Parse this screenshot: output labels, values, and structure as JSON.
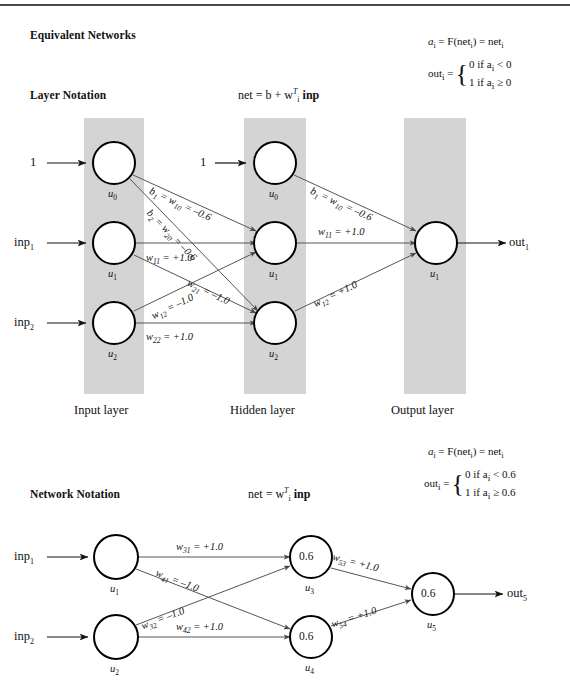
{
  "figure": {
    "title": "Equivalent Networks"
  },
  "sections": [
    {
      "id": "layer",
      "heading": "Layer Notation",
      "net_equation": "net = b + w",
      "net_equation_sup": "T",
      "net_equation_sub": "i",
      "net_equation_tail": "inp",
      "activation": {
        "a_label": "a",
        "a_sub": "i",
        "eq1": "= F(net",
        "eq1_sub": "i",
        "eq1_tail": ") = net",
        "eq1_tail_sub": "i",
        "out_label": "out",
        "out_sub": "i",
        "out_eq": "=",
        "case_0": "0  if a",
        "case_0_sub": "i",
        "case_0_tail": "< 0",
        "case_1": "1  if a",
        "case_1_sub": "i",
        "case_1_tail": "≥ 0"
      },
      "layer_captions": [
        "Input layer",
        "Hidden layer",
        "Output layer"
      ],
      "inputs": [
        {
          "label": "1",
          "sub": ""
        },
        {
          "label": "inp",
          "sub": "1"
        },
        {
          "label": "inp",
          "sub": "2"
        }
      ],
      "output": {
        "label": "out",
        "sub": "1"
      },
      "nodes": [
        {
          "id": "in-u0",
          "name": "u",
          "sub": "0",
          "value": "",
          "layer": "input"
        },
        {
          "id": "in-u1",
          "name": "u",
          "sub": "1",
          "value": "",
          "layer": "input"
        },
        {
          "id": "in-u2",
          "name": "u",
          "sub": "2",
          "value": "",
          "layer": "input"
        },
        {
          "id": "hid-u0",
          "name": "u",
          "sub": "0",
          "value": "",
          "layer": "hidden"
        },
        {
          "id": "hid-u1",
          "name": "u",
          "sub": "1",
          "value": "",
          "layer": "hidden"
        },
        {
          "id": "hid-u2",
          "name": "u",
          "sub": "2",
          "value": "",
          "layer": "hidden"
        },
        {
          "id": "out-u1",
          "name": "u",
          "sub": "1",
          "value": "",
          "layer": "output"
        }
      ],
      "hidden_bias_input": "1",
      "edges": [
        {
          "id": "e-b1",
          "text": "b",
          "sub": "1",
          "mid": "= w",
          "mid_sub": "10",
          "tail": "= –0.6"
        },
        {
          "id": "e-b2",
          "text": "b",
          "sub": "2",
          "mid": "= w",
          "mid_sub": "20",
          "tail": "= –0.6"
        },
        {
          "id": "e-w11",
          "text": "w",
          "sub": "11",
          "mid": "",
          "mid_sub": "",
          "tail": "= +1.0"
        },
        {
          "id": "e-w21",
          "text": "w",
          "sub": "21",
          "mid": "",
          "mid_sub": "",
          "tail": "= –1.0"
        },
        {
          "id": "e-w12",
          "text": "w",
          "sub": "12",
          "mid": "",
          "mid_sub": "",
          "tail": "= –1.0"
        },
        {
          "id": "e-w22",
          "text": "w",
          "sub": "22",
          "mid": "",
          "mid_sub": "",
          "tail": "= +1.0"
        },
        {
          "id": "e-hb1",
          "text": "b",
          "sub": "1",
          "mid": "= w",
          "mid_sub": "10",
          "tail": "= –0.6"
        },
        {
          "id": "e-hw11",
          "text": "w",
          "sub": "11",
          "mid": "",
          "mid_sub": "",
          "tail": "= +1.0"
        },
        {
          "id": "e-hw12",
          "text": "w",
          "sub": "12",
          "mid": "",
          "mid_sub": "",
          "tail": "= +1.0"
        }
      ]
    },
    {
      "id": "network",
      "heading": "Network Notation",
      "net_equation": "net = w",
      "net_equation_sup": "T",
      "net_equation_sub": "i",
      "net_equation_tail": "inp",
      "activation": {
        "a_label": "a",
        "a_sub": "i",
        "eq1": "= F(net",
        "eq1_sub": "i",
        "eq1_tail": ") = net",
        "eq1_tail_sub": "i",
        "out_label": "out",
        "out_sub": "i",
        "out_eq": "=",
        "case_0": "0  if a",
        "case_0_sub": "i",
        "case_0_tail": "< 0.6",
        "case_1": "1  if a",
        "case_1_sub": "i",
        "case_1_tail": "≥ 0.6"
      },
      "inputs": [
        {
          "label": "inp",
          "sub": "1"
        },
        {
          "label": "inp",
          "sub": "2"
        }
      ],
      "output": {
        "label": "out",
        "sub": "5"
      },
      "nodes": [
        {
          "id": "n-u1",
          "name": "u",
          "sub": "1",
          "value": ""
        },
        {
          "id": "n-u2",
          "name": "u",
          "sub": "2",
          "value": ""
        },
        {
          "id": "n-u3",
          "name": "u",
          "sub": "3",
          "value": "0.6"
        },
        {
          "id": "n-u4",
          "name": "u",
          "sub": "4",
          "value": "0.6"
        },
        {
          "id": "n-u5",
          "name": "u",
          "sub": "5",
          "value": "0.6"
        }
      ],
      "edges": [
        {
          "id": "e-w31",
          "text": "w",
          "sub": "31",
          "tail": "= +1.0"
        },
        {
          "id": "e-w41",
          "text": "w",
          "sub": "41",
          "tail": "= –1.0"
        },
        {
          "id": "e-w32",
          "text": "w",
          "sub": "32",
          "tail": "= –1.0"
        },
        {
          "id": "e-w42",
          "text": "w",
          "sub": "42",
          "tail": "= +1.0"
        },
        {
          "id": "e-w53",
          "text": "w",
          "sub": "53",
          "tail": "= +1.0"
        },
        {
          "id": "e-w54",
          "text": "w",
          "sub": "54",
          "tail": "= +1.0"
        }
      ]
    }
  ],
  "colors": {
    "band": "#d3d3d3",
    "stroke": "#000000",
    "edge": "#555555",
    "text": "#111111"
  }
}
